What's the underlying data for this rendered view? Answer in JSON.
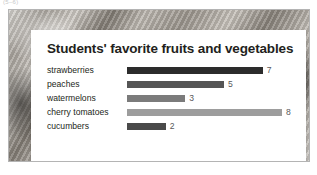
{
  "page_marker": "(5–6)",
  "card": {
    "title": "Students' favorite fruits and vegetables"
  },
  "chart_data": {
    "type": "bar",
    "orientation": "horizontal",
    "title": "Students' favorite fruits and vegetables",
    "xlabel": "",
    "ylabel": "",
    "xlim": [
      0,
      8
    ],
    "grid": false,
    "legend": null,
    "value_labels": true,
    "categories": [
      "strawberries",
      "peaches",
      "watermelons",
      "cherry tomatoes",
      "cucumbers"
    ],
    "values": [
      7,
      5,
      3,
      8,
      2
    ],
    "bar_colors": [
      "#2c2c2c",
      "#555555",
      "#7b7b7b",
      "#9d9d9d",
      "#4a4a4a"
    ],
    "bars": [
      {
        "label": "strawberries",
        "value": 7,
        "value_text": "7",
        "color": "#2c2c2c"
      },
      {
        "label": "peaches",
        "value": 5,
        "value_text": "5",
        "color": "#555555"
      },
      {
        "label": "watermelons",
        "value": 3,
        "value_text": "3",
        "color": "#7b7b7b"
      },
      {
        "label": "cherry tomatoes",
        "value": 8,
        "value_text": "8",
        "color": "#9d9d9d"
      },
      {
        "label": "cucumbers",
        "value": 2,
        "value_text": "2",
        "color": "#4a4a4a"
      }
    ]
  },
  "colors": {
    "card_background": "#ffffff",
    "title_text": "#231f20",
    "label_text": "#231f20",
    "value_text": "#58585a",
    "frame_border": "#b4b4b4"
  }
}
